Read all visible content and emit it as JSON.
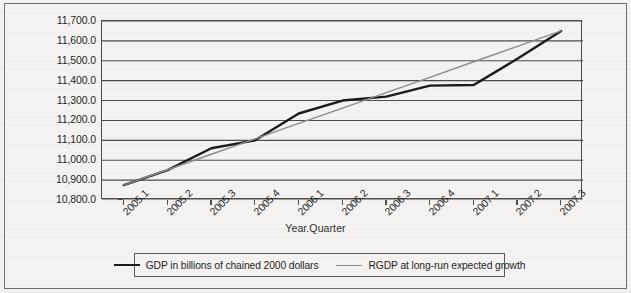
{
  "chart_data": {
    "type": "line",
    "title": "",
    "xlabel": "Year.Quarter",
    "ylabel": "RGDP (billions, 2000)",
    "categories": [
      "2005.1",
      "2005.2",
      "2005.3",
      "2005.4",
      "2006.1",
      "2006.2",
      "2006.3",
      "2006.4",
      "2007.1",
      "2007.2",
      "2007.3"
    ],
    "ylim": [
      10800,
      11700
    ],
    "ytick_step": 100,
    "yticks": [
      "11,700.0",
      "11,600.0",
      "11,500.0",
      "11,400.0",
      "11,300.0",
      "11,200.0",
      "11,100.0",
      "11,000.0",
      "10,900.0",
      "10,800.0"
    ],
    "ytick_values": [
      11700,
      11600,
      11500,
      11400,
      11300,
      11200,
      11100,
      11000,
      10900,
      10800
    ],
    "grid": true,
    "legend_position": "bottom",
    "series": [
      {
        "name": "GDP in billions of chained 2000 dollars",
        "color": "#1a1a1a",
        "width": 2.4,
        "values": [
          10875,
          10950,
          11060,
          11100,
          11235,
          11300,
          11320,
          11375,
          11378,
          11510,
          11650
        ]
      },
      {
        "name": "RGDP at long-run expected growth",
        "color": "#8d8d8d",
        "width": 1.4,
        "values": [
          10875,
          10952,
          11030,
          11107,
          11185,
          11262,
          11340,
          11417,
          11495,
          11572,
          11650
        ]
      }
    ]
  },
  "legend": {
    "items": [
      {
        "label": "GDP in billions of chained 2000 dollars",
        "swatch": "line-dark"
      },
      {
        "label": "RGDP at long-run expected growth",
        "swatch": "line-gray"
      }
    ]
  }
}
